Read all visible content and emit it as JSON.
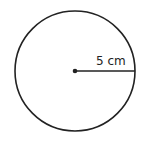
{
  "diagram": {
    "type": "circle",
    "radius_label": "5 cm",
    "stroke_color": "#222222",
    "background": "#ffffff"
  }
}
